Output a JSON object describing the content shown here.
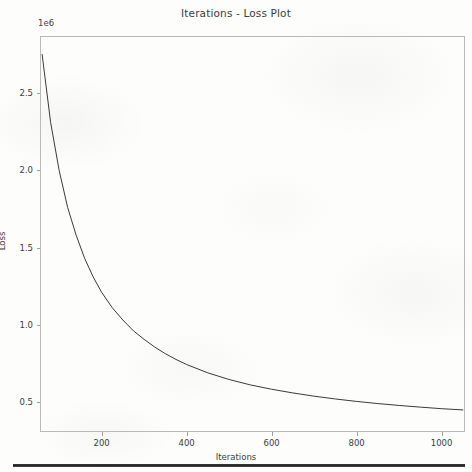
{
  "chart_data": {
    "type": "line",
    "title": "Iterations - Loss Plot",
    "xlabel": "Iterations",
    "ylabel": "Loss",
    "y_offset_label": "1e6",
    "y_offset_multiplier": 1000000,
    "grid": false,
    "legend": null,
    "line_color": "#3a3a3a",
    "xlim": [
      55,
      1055
    ],
    "ylim": [
      305000,
      2870000
    ],
    "xticks": [
      200,
      400,
      600,
      800,
      1000
    ],
    "xtick_labels": [
      "200",
      "400",
      "600",
      "800",
      "1000"
    ],
    "yticks": [
      500000,
      1000000,
      1500000,
      2000000,
      2500000
    ],
    "ytick_labels": [
      "0.5",
      "1.0",
      "1.5",
      "2.0",
      "2.5"
    ],
    "series": [
      {
        "name": "Loss",
        "x": [
          60,
          80,
          100,
          120,
          140,
          160,
          180,
          200,
          225,
          250,
          275,
          300,
          325,
          350,
          375,
          400,
          450,
          500,
          550,
          600,
          650,
          700,
          750,
          800,
          850,
          900,
          950,
          1000,
          1050
        ],
        "values": [
          2750000,
          2310000,
          2000000,
          1760000,
          1580000,
          1430000,
          1310000,
          1210000,
          1110000,
          1030000,
          960000,
          905000,
          855000,
          812000,
          775000,
          742000,
          688000,
          645000,
          610000,
          582000,
          558000,
          537000,
          519000,
          503000,
          489000,
          477000,
          466000,
          456000,
          448000
        ]
      }
    ]
  },
  "figure": {
    "background_color": "#fdfdfc",
    "frame_color": "#b9b9b9",
    "text_color": "#3c3c3c",
    "bottom_rule_color": "#2b2b2b"
  }
}
